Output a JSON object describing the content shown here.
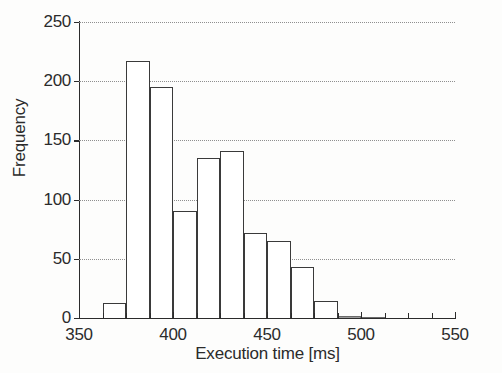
{
  "chart_data": {
    "type": "bar",
    "title": "",
    "subtitle": "",
    "xlabel": "Execution time [ms]",
    "ylabel": "Frequency",
    "xlim": [
      350,
      550
    ],
    "ylim": [
      0,
      250
    ],
    "grid": true,
    "legend": null,
    "xticks": [
      350,
      400,
      450,
      500,
      550
    ],
    "xtick_labels": [
      "350",
      "400",
      "450",
      "500",
      "550"
    ],
    "yticks": [
      0,
      50,
      100,
      150,
      200,
      250
    ],
    "ytick_labels": [
      "0",
      "50",
      "100",
      "150",
      "200",
      "250"
    ],
    "xtick_minor_step": 12.5,
    "bin_width": 12.5,
    "bin_edges": [
      362.5,
      375,
      387.5,
      400,
      412.5,
      425,
      437.5,
      450,
      462.5,
      475,
      487.5,
      500,
      512.5
    ],
    "categories": [
      "362.5-375",
      "375-387.5",
      "387.5-400",
      "400-412.5",
      "412.5-425",
      "425-437.5",
      "437.5-450",
      "450-462.5",
      "462.5-475",
      "475-487.5",
      "487.5-500",
      "500-512.5"
    ],
    "values": [
      13,
      217,
      195,
      90,
      135,
      141,
      72,
      65,
      43,
      14,
      2,
      1
    ],
    "bar_color": "#ffffff",
    "bar_edge_color": "#3a3a3a",
    "grid_color": "#8f8f8f",
    "axis_color": "#2b2b2b",
    "background_color": "#fdfdfc"
  },
  "figure": {
    "ylabel": "Frequency",
    "xlabel": "Execution time [ms]"
  }
}
